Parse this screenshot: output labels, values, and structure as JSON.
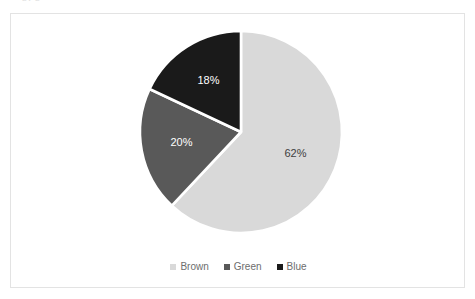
{
  "document": {
    "clipped_header_text": "by  p"
  },
  "chart_data": {
    "type": "pie",
    "title": "",
    "categories": [
      "Brown",
      "Green",
      "Blue"
    ],
    "values": [
      62,
      20,
      18
    ],
    "value_labels": [
      "62%",
      "20%",
      "18%"
    ],
    "colors": [
      "#d9d9d9",
      "#595959",
      "#1a1a1a"
    ],
    "label_text_colors": [
      "#404040",
      "#ffffff",
      "#ffffff"
    ],
    "start_angle_deg": 0,
    "direction": "clockwise",
    "slice_gap": true,
    "gap_color": "#ffffff",
    "legend": {
      "position": "bottom",
      "entries": [
        {
          "label": "Brown",
          "color": "#d9d9d9"
        },
        {
          "label": "Green",
          "color": "#595959"
        },
        {
          "label": "Blue",
          "color": "#1a1a1a"
        }
      ]
    },
    "grid": false,
    "xlabel": "",
    "ylabel": ""
  },
  "frame": {
    "border_color": "#e3e3e3",
    "background": "#ffffff"
  }
}
